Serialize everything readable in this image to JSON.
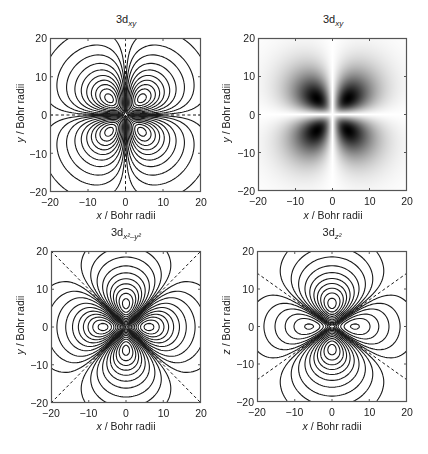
{
  "chart_data": [
    {
      "type": "contour",
      "id": "dxy-contour",
      "title": "3d_xy",
      "title_base": "3d",
      "title_sub": "xy",
      "orbital": "3dxy",
      "xlabel_var": "x",
      "xlabel_rest": " / Bohr radii",
      "ylabel_var": "y",
      "ylabel_rest": " / Bohr radii",
      "xlim": [
        -20,
        20
      ],
      "ylim": [
        -20,
        20
      ],
      "xticks": [
        -20,
        -10,
        0,
        10,
        20
      ],
      "yticks": [
        -20,
        -10,
        0,
        10,
        20
      ],
      "box": [
        50,
        38,
        201,
        192
      ],
      "nodal_lines": "x=0 and y=0 (dashed)",
      "positive_lobes": "solid contours, quadrants I and III",
      "negative_lobes": "dashed contours, quadrants II and IV",
      "lobe_peak_r": 5
    },
    {
      "type": "heatmap",
      "id": "dxy-density",
      "title": "3d_xy",
      "title_base": "3d",
      "title_sub": "xy",
      "orbital": "3dxy",
      "xlabel_var": "x",
      "xlabel_rest": " / Bohr radii",
      "ylabel_var": "y",
      "ylabel_rest": " / Bohr radii",
      "xlim": [
        -20,
        20
      ],
      "ylim": [
        -20,
        20
      ],
      "xticks": [
        -20,
        -10,
        0,
        10,
        20
      ],
      "yticks": [
        -20,
        -10,
        0,
        10,
        20
      ],
      "box": [
        258,
        38,
        407,
        191
      ],
      "colormap": "grayscale (white=0, black=max |psi|^2)",
      "peaks": [
        [
          5,
          5
        ],
        [
          -5,
          5
        ],
        [
          -5,
          -5
        ],
        [
          5,
          -5
        ]
      ]
    },
    {
      "type": "contour",
      "id": "dx2y2-contour",
      "title": "3d_x2-y2",
      "title_base": "3d",
      "title_sub": "x²–y²",
      "orbital": "3dx2y2",
      "xlabel_var": "x",
      "xlabel_rest": " / Bohr radii",
      "ylabel_var": "y",
      "ylabel_rest": " / Bohr radii",
      "xlim": [
        -20,
        20
      ],
      "ylim": [
        -20,
        20
      ],
      "xticks": [
        -20,
        -10,
        0,
        10,
        20
      ],
      "yticks": [
        -20,
        -10,
        0,
        10,
        20
      ],
      "box": [
        51,
        251,
        201,
        403
      ],
      "nodal_lines": "y=x and y=-x (dashed)",
      "positive_lobes": "solid contours along x-axis",
      "negative_lobes": "dashed contours along y-axis",
      "lobe_peak_r": 6
    },
    {
      "type": "contour",
      "id": "dz2-contour",
      "title": "3d_z2",
      "title_base": "3d",
      "title_sub": "z²",
      "orbital": "3dz2",
      "xlabel_var": "x",
      "xlabel_rest": " / Bohr radii",
      "ylabel_var": "z",
      "ylabel_rest": " / Bohr radii",
      "xlim": [
        -20,
        20
      ],
      "ylim": [
        -20,
        20
      ],
      "xticks": [
        -20,
        -10,
        0,
        10,
        20
      ],
      "yticks": [
        -20,
        -10,
        0,
        10,
        20
      ],
      "box": [
        257,
        251,
        407,
        402
      ],
      "nodal_lines": "cones at 54.7° from z-axis (dashed)",
      "positive_lobes": "solid contours along z-axis",
      "negative_lobes": "dashed contours (torus) along x-axis",
      "lobe_peak_r": 6
    }
  ],
  "contour_levels_fraction": [
    0.03,
    0.08,
    0.15,
    0.25,
    0.36,
    0.48,
    0.6,
    0.72,
    0.84,
    0.95
  ],
  "colors": {
    "line": "#1a1a1a",
    "axis": "#555555",
    "background": "#ffffff"
  }
}
